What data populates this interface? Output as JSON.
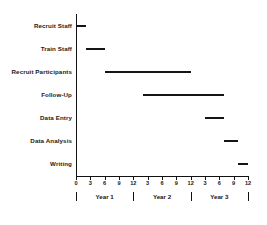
{
  "chart_data": {
    "type": "bar",
    "orientation": "horizontal",
    "subtype": "gantt",
    "title": "",
    "xlabel": "",
    "ylabel": "",
    "xlim": [
      0,
      36
    ],
    "grid": false,
    "legend": null,
    "categories": [
      "Recruit Staff",
      "Train Staff",
      "Recruit Participants",
      "Follow-Up",
      "Data Entry",
      "Data Analysis",
      "Writing"
    ],
    "tasks": [
      {
        "label": "Recruit Staff",
        "start": 0,
        "end": 2,
        "row": 0
      },
      {
        "label": "Train Staff",
        "start": 2,
        "end": 6,
        "row": 1
      },
      {
        "label": "Recruit Participants",
        "start": 6,
        "end": 24,
        "row": 2
      },
      {
        "label": "Follow-Up",
        "start": 14,
        "end": 31,
        "row": 3
      },
      {
        "label": "Data Entry",
        "start": 27,
        "end": 31,
        "row": 4
      },
      {
        "label": "Data Analysis",
        "start": 31,
        "end": 34,
        "row": 5
      },
      {
        "label": "Writing",
        "start": 34,
        "end": 36,
        "row": 6
      }
    ],
    "x_ticks": [
      {
        "value": 0,
        "label": "0"
      },
      {
        "value": 3,
        "label": "3"
      },
      {
        "value": 6,
        "label": "6"
      },
      {
        "value": 9,
        "label": "9"
      },
      {
        "value": 12,
        "label": "12"
      },
      {
        "value": 15,
        "label": "3"
      },
      {
        "value": 18,
        "label": "6"
      },
      {
        "value": 21,
        "label": "9"
      },
      {
        "value": 24,
        "label": "12"
      },
      {
        "value": 27,
        "label": "3"
      },
      {
        "value": 30,
        "label": "6"
      },
      {
        "value": 33,
        "label": "9"
      },
      {
        "value": 36,
        "label": "12"
      }
    ],
    "year_separators": [
      0,
      12,
      24,
      36
    ],
    "year_bands": [
      {
        "label": "Year 1",
        "start": 0,
        "end": 12
      },
      {
        "label": "Year 2",
        "start": 12,
        "end": 24
      },
      {
        "label": "Year 3",
        "start": 24,
        "end": 36
      }
    ],
    "colors": {
      "bar": "#151515",
      "axis": "#111111",
      "text": "#1a1a1a",
      "background": "#ffffff"
    }
  },
  "caption": ""
}
